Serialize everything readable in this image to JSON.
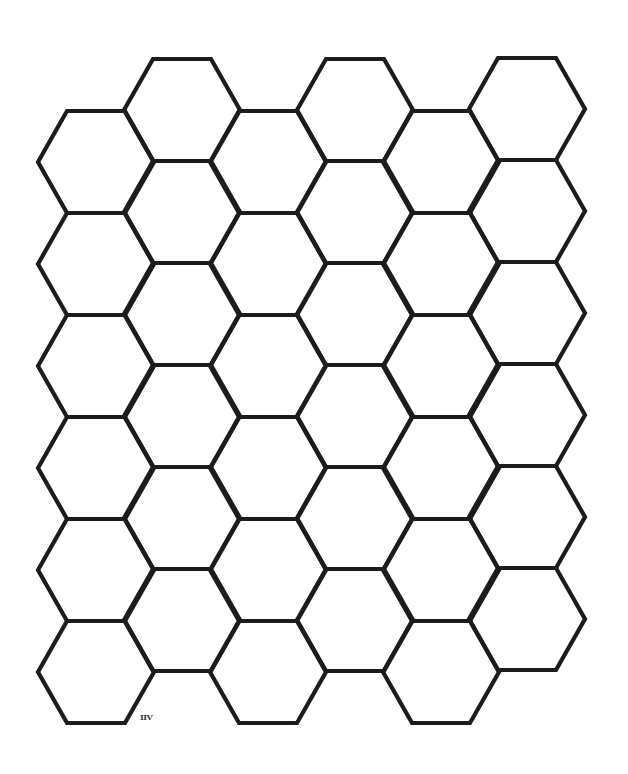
{
  "page": {
    "background": "#ffffff",
    "width": 628,
    "height": 774
  },
  "honeycomb": {
    "orientation": "flat-top",
    "stroke_color": "#1c1c1c",
    "stroke_width": 4.2,
    "side_length": 58,
    "half_height": 51,
    "columns": [
      {
        "index": 0,
        "center_x": 96,
        "first_top_y": 111,
        "count": 6
      },
      {
        "index": 1,
        "center_x": 182,
        "first_top_y": 59,
        "count": 6
      },
      {
        "index": 2,
        "center_x": 268,
        "first_top_y": 111,
        "count": 6
      },
      {
        "index": 3,
        "center_x": 355,
        "first_top_y": 59,
        "count": 6
      },
      {
        "index": 4,
        "center_x": 441,
        "first_top_y": 111,
        "count": 6
      },
      {
        "index": 5,
        "center_x": 527,
        "first_top_y": 58,
        "count": 6
      }
    ],
    "row_spacing": 102
  },
  "mark": {
    "text": "IIV",
    "x": 140,
    "y": 713
  }
}
